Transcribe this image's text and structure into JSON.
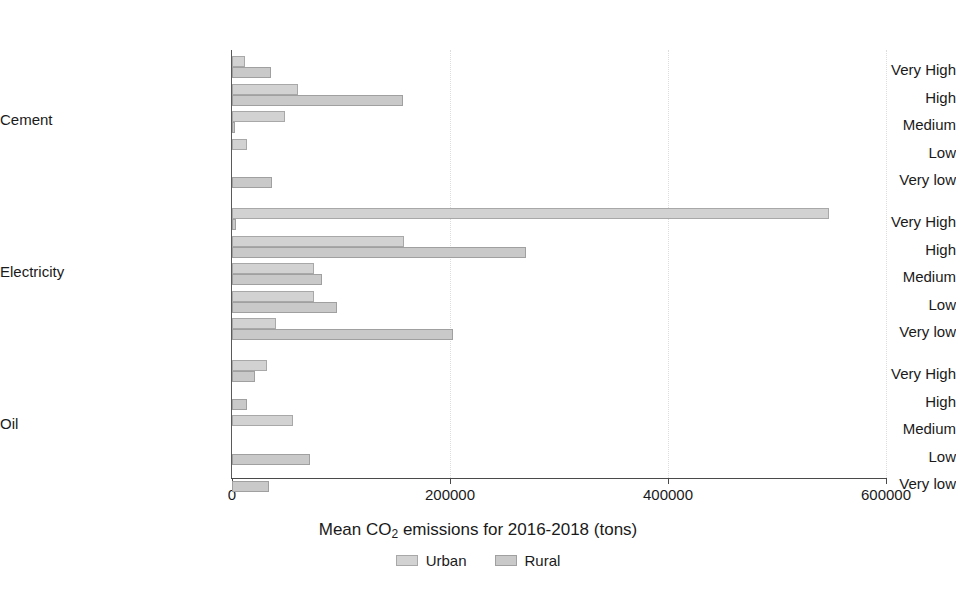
{
  "chart_data": {
    "type": "bar",
    "orientation": "horizontal",
    "title": "",
    "xlabel": "Mean CO2 emissions for 2016-2018 (tons)",
    "xlabel_parts": {
      "pre": "Mean CO",
      "sub": "2",
      "post": " emissions for 2016-2018 (tons)"
    },
    "ylabel": "",
    "xlim": [
      0,
      600000
    ],
    "xticks": [
      0,
      200000,
      400000,
      600000
    ],
    "xtick_labels": [
      "0",
      "200000",
      "400000",
      "600000"
    ],
    "grid": "vertical-dotted",
    "legend_position": "bottom-center",
    "legend": [
      "Urban",
      "Rural"
    ],
    "groups": [
      "Cement",
      "Electricity",
      "Oil"
    ],
    "categories": [
      "Very High",
      "High",
      "Medium",
      "Low",
      "Very low"
    ],
    "series": [
      {
        "name": "Urban",
        "color": "#d2d2d2",
        "values": {
          "Cement": [
            12000,
            61000,
            49000,
            14000,
            0
          ],
          "Electricity": [
            548000,
            158000,
            75000,
            75000,
            40000
          ],
          "Oil": [
            32000,
            0,
            56000,
            0,
            0
          ]
        }
      },
      {
        "name": "Rural",
        "color": "#c9c9c9",
        "values": {
          "Cement": [
            36000,
            157000,
            3000,
            0,
            37000
          ],
          "Electricity": [
            4000,
            270000,
            83000,
            96000,
            203000
          ],
          "Oil": [
            21000,
            14000,
            0,
            72000,
            34000
          ]
        }
      }
    ]
  },
  "axis": {
    "x_title_pre": "Mean CO",
    "x_title_sub": "2",
    "x_title_post": " emissions for 2016-2018 (tons)",
    "ticks": [
      "0",
      "200000",
      "400000",
      "600000"
    ]
  },
  "legend": {
    "urban": "Urban",
    "rural": "Rural"
  }
}
